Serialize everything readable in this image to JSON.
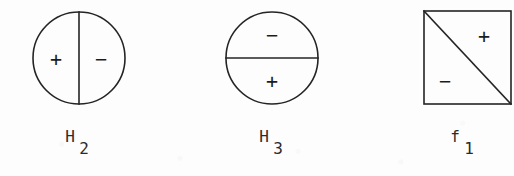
{
  "figure": {
    "background_color": "#fdfdfd",
    "ink_color": "#242424",
    "canvas": {
      "width": 514,
      "height": 176
    },
    "items": [
      {
        "id": "H2",
        "shape": "circle",
        "divider": "vertical-diameter",
        "caption_base": "H",
        "caption_sub": "2",
        "caption_full": "H2",
        "regions": [
          {
            "position": "left",
            "sign": "+"
          },
          {
            "position": "right",
            "sign": "−"
          }
        ],
        "geometry": {
          "cx": 79,
          "cy": 58,
          "r": 46,
          "divider_x1": 79,
          "divider_y1": 12,
          "divider_x2": 79,
          "divider_y2": 104,
          "sign_a_x": 56,
          "sign_a_y": 59,
          "sign_b_x": 101,
          "sign_b_y": 59,
          "caption_x": 70,
          "caption_y": 142,
          "caption_sub_x": 84,
          "caption_sub_y": 154
        }
      },
      {
        "id": "H3",
        "shape": "circle",
        "divider": "horizontal-diameter",
        "caption_base": "H",
        "caption_sub": "3",
        "caption_full": "H3",
        "regions": [
          {
            "position": "top",
            "sign": "−"
          },
          {
            "position": "bottom",
            "sign": "+"
          }
        ],
        "geometry": {
          "cx": 272,
          "cy": 58,
          "r": 46,
          "divider_x1": 226,
          "divider_y1": 58,
          "divider_x2": 318,
          "divider_y2": 58,
          "sign_a_x": 272,
          "sign_a_y": 35,
          "sign_b_x": 272,
          "sign_b_y": 81,
          "caption_x": 264,
          "caption_y": 142,
          "caption_sub_x": 278,
          "caption_sub_y": 154
        }
      },
      {
        "id": "f1",
        "shape": "square",
        "divider": "main-diagonal",
        "caption_base": "f",
        "caption_sub": "1",
        "caption_full": "f1",
        "regions": [
          {
            "position": "upper-right",
            "sign": "+"
          },
          {
            "position": "lower-left",
            "sign": "−"
          }
        ],
        "geometry": {
          "x": 424,
          "y": 11,
          "size": 94,
          "divider_x1": 424,
          "divider_y1": 11,
          "divider_x2": 511,
          "divider_y2": 104,
          "sign_a_x": 484,
          "sign_a_y": 36,
          "sign_b_x": 445,
          "sign_b_y": 81,
          "caption_x": 455,
          "caption_y": 142,
          "caption_sub_x": 469,
          "caption_sub_y": 154
        }
      }
    ]
  }
}
